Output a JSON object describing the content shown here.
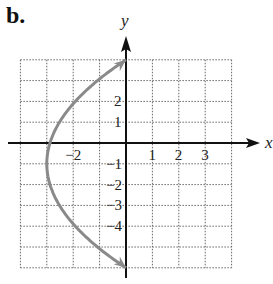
{
  "panel_label": "b.",
  "chart_data": {
    "type": "line",
    "title": "",
    "xlabel": "x",
    "ylabel": "y",
    "xlim": [
      -4,
      4
    ],
    "ylim": [
      -6,
      4
    ],
    "grid": true,
    "x_tick_labels": [
      "-2",
      "1",
      "2",
      "3"
    ],
    "y_tick_labels": [
      "2",
      "1",
      "-1",
      "-2",
      "-3",
      "-4"
    ],
    "series": [
      {
        "name": "parabola opening right",
        "color": "#8a8a8a",
        "vertex": [
          -3,
          -1
        ],
        "endpoints": [
          [
            0,
            4
          ],
          [
            0,
            -6
          ]
        ],
        "arrows_at_ends": true,
        "points": [
          [
            0,
            4
          ],
          [
            -1.08,
            2
          ],
          [
            -1.92,
            0
          ],
          [
            -2.52,
            -2
          ],
          [
            -2.88,
            -4
          ],
          [
            -3,
            -1
          ],
          [
            0,
            -6
          ]
        ]
      }
    ]
  }
}
